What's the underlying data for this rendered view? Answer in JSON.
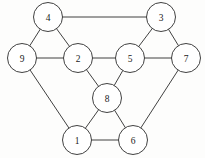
{
  "figure": {
    "type": "undirected-graph-diagram",
    "width": 205,
    "height": 158,
    "background_color": "#fdfdfc",
    "stroke_color": "#2b2b2b",
    "node_fill_color": "#ffffff",
    "label_color": "#1a1a1a",
    "node_radius": 14.5,
    "stroke_width": 0.9
  },
  "nodes": [
    {
      "id": "4",
      "label": "4",
      "cx": 48,
      "cy": 17,
      "r": 14.5
    },
    {
      "id": "3",
      "label": "3",
      "cx": 161,
      "cy": 17,
      "r": 14.5
    },
    {
      "id": "9",
      "label": "9",
      "cx": 22,
      "cy": 58,
      "r": 14.5
    },
    {
      "id": "2",
      "label": "2",
      "cx": 78,
      "cy": 58,
      "r": 14.5
    },
    {
      "id": "5",
      "label": "5",
      "cx": 130,
      "cy": 58,
      "r": 14.5
    },
    {
      "id": "7",
      "label": "7",
      "cx": 186,
      "cy": 58,
      "r": 14.5
    },
    {
      "id": "8",
      "label": "8",
      "cx": 107,
      "cy": 98,
      "r": 14.5
    },
    {
      "id": "1",
      "label": "1",
      "cx": 77,
      "cy": 140,
      "r": 14.5
    },
    {
      "id": "6",
      "label": "6",
      "cx": 133,
      "cy": 140,
      "r": 14.5
    }
  ],
  "edges": [
    {
      "from": "4",
      "to": "3"
    },
    {
      "from": "4",
      "to": "9"
    },
    {
      "from": "4",
      "to": "2"
    },
    {
      "from": "9",
      "to": "2"
    },
    {
      "from": "2",
      "to": "5"
    },
    {
      "from": "3",
      "to": "5"
    },
    {
      "from": "3",
      "to": "7"
    },
    {
      "from": "5",
      "to": "7"
    },
    {
      "from": "2",
      "to": "8"
    },
    {
      "from": "5",
      "to": "8"
    },
    {
      "from": "8",
      "to": "1"
    },
    {
      "from": "8",
      "to": "6"
    },
    {
      "from": "9",
      "to": "1"
    },
    {
      "from": "7",
      "to": "6"
    },
    {
      "from": "1",
      "to": "6"
    }
  ]
}
